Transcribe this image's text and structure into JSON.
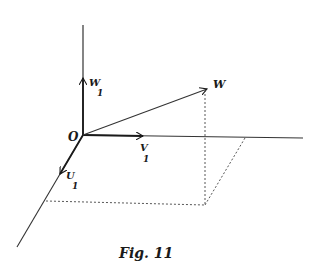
{
  "figure": {
    "caption": "Fig. 11",
    "origin_label": "O",
    "labels": {
      "w1": "W",
      "w1_sub": "1",
      "v1": "V",
      "v1_sub": "1",
      "u1": "U",
      "u1_sub": "1",
      "w": "W"
    },
    "colors": {
      "ink": "#1a1a1a",
      "background": "#ffffff"
    }
  }
}
